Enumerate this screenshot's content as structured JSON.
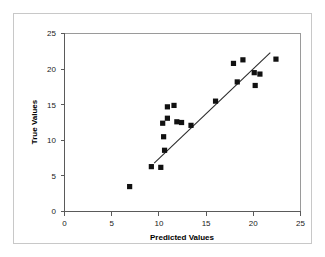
{
  "figure": {
    "kind": "scatter-plot-with-regression-line"
  },
  "chart_data": {
    "type": "scatter",
    "title": "",
    "xlabel": "Predicted Values",
    "ylabel": "True Values",
    "xlim": [
      0,
      25
    ],
    "ylim": [
      0,
      25
    ],
    "xticks": [
      0,
      5,
      10,
      15,
      20,
      25
    ],
    "yticks": [
      0,
      5,
      10,
      15,
      20,
      25
    ],
    "xtick_labels": [
      "0",
      "5",
      "10",
      "15",
      "20",
      "25"
    ],
    "ytick_labels": [
      "0",
      "5",
      "10",
      "15",
      "20",
      "25"
    ],
    "grid": false,
    "legend": null,
    "marker": "filled-square",
    "marker_color": "#111111",
    "points": [
      {
        "x": 6.9,
        "y": 3.5
      },
      {
        "x": 9.2,
        "y": 6.3
      },
      {
        "x": 10.2,
        "y": 6.2
      },
      {
        "x": 10.6,
        "y": 8.6
      },
      {
        "x": 10.5,
        "y": 10.5
      },
      {
        "x": 10.4,
        "y": 12.4
      },
      {
        "x": 10.9,
        "y": 13.1
      },
      {
        "x": 10.9,
        "y": 14.7
      },
      {
        "x": 11.6,
        "y": 14.9
      },
      {
        "x": 11.9,
        "y": 12.6
      },
      {
        "x": 12.4,
        "y": 12.5
      },
      {
        "x": 13.4,
        "y": 12.1
      },
      {
        "x": 16.0,
        "y": 15.5
      },
      {
        "x": 17.9,
        "y": 20.8
      },
      {
        "x": 18.3,
        "y": 18.2
      },
      {
        "x": 18.9,
        "y": 21.3
      },
      {
        "x": 20.1,
        "y": 19.5
      },
      {
        "x": 20.2,
        "y": 17.7
      },
      {
        "x": 20.7,
        "y": 19.3
      },
      {
        "x": 22.4,
        "y": 21.4
      }
    ],
    "fit_line": {
      "name": "regression-line",
      "color": "#2b2b2b",
      "x_start": 9.5,
      "y_start": 6.8,
      "x_end": 21.8,
      "y_end": 22.3
    }
  }
}
